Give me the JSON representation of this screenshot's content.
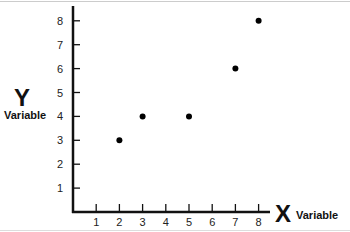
{
  "chart_data": {
    "type": "scatter",
    "title": "",
    "xlabel": "X Variable",
    "ylabel": "Y Variable",
    "x_axis": {
      "letter": "X",
      "word": "Variable",
      "ticks": [
        1,
        2,
        3,
        4,
        5,
        6,
        7,
        8
      ],
      "range": [
        0,
        8.5
      ]
    },
    "y_axis": {
      "letter": "Y",
      "word": "Variable",
      "ticks": [
        1,
        2,
        3,
        4,
        5,
        6,
        7,
        8
      ],
      "range": [
        0,
        8.5
      ]
    },
    "points": [
      {
        "x": 2,
        "y": 3
      },
      {
        "x": 3,
        "y": 4
      },
      {
        "x": 5,
        "y": 4
      },
      {
        "x": 7,
        "y": 6
      },
      {
        "x": 8,
        "y": 8
      }
    ],
    "grid": false,
    "legend": null,
    "marker_color": "#000000"
  }
}
